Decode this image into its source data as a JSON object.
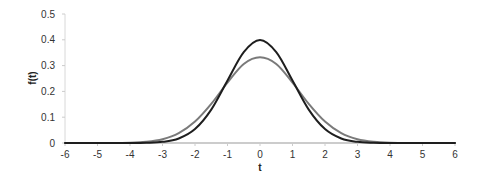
{
  "chart_data": {
    "type": "line",
    "title": "",
    "xlabel": "t",
    "ylabel": "f(t)",
    "xlim": [
      -6,
      6
    ],
    "ylim": [
      0,
      0.5
    ],
    "grid": false,
    "legend": null,
    "x_ticks": [
      "-6",
      "-5",
      "-4",
      "-3",
      "-2",
      "-1",
      "0",
      "1",
      "2",
      "3",
      "4",
      "5",
      "6"
    ],
    "y_ticks": [
      "0",
      "0.1",
      "0.2",
      "0.3",
      "0.4",
      "0.5"
    ],
    "series": [
      {
        "name": "narrow curve (black)",
        "color": "#1e1e1e",
        "peak": 0.4,
        "x": [
          -6,
          -5,
          -4,
          -3.5,
          -3,
          -2.5,
          -2,
          -1.5,
          -1,
          -0.5,
          0,
          0.5,
          1,
          1.5,
          2,
          2.5,
          3,
          3.5,
          4,
          5,
          6
        ],
        "values": [
          0,
          0,
          0.0001,
          0.0009,
          0.0044,
          0.0175,
          0.054,
          0.1295,
          0.242,
          0.352,
          0.399,
          0.352,
          0.242,
          0.1295,
          0.054,
          0.0175,
          0.0044,
          0.0009,
          0.0001,
          0,
          0
        ]
      },
      {
        "name": "wide curve (grey)",
        "color": "#7a7a7a",
        "peak": 0.33,
        "x": [
          -6,
          -5,
          -4,
          -3.5,
          -3,
          -2.5,
          -2,
          -1.5,
          -1,
          -0.5,
          0,
          0.5,
          1,
          1.5,
          2,
          2.5,
          3,
          3.5,
          4,
          5,
          6
        ],
        "values": [
          0,
          0.0001,
          0.0013,
          0.0047,
          0.0146,
          0.0381,
          0.083,
          0.1516,
          0.2342,
          0.3065,
          0.3324,
          0.3065,
          0.2342,
          0.1516,
          0.083,
          0.0381,
          0.0146,
          0.0047,
          0.0013,
          0.0001,
          0
        ]
      }
    ]
  }
}
